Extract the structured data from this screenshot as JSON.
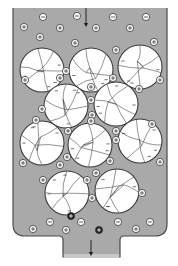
{
  "diagram": {
    "colors": {
      "background": "#ffffff",
      "liquid": "#a9a9a9",
      "vessel_outline": "#4a4a4a",
      "particle_fill": "#ffffff",
      "particle_outline": "#3a3a3a",
      "crack_lines": "#3a3a3a",
      "ion_fill": "#ffffff",
      "ion_outline": "#3a3a3a",
      "dark_ion_fill": "#1e1e1e"
    },
    "flow": {
      "inlet_arrow": {
        "x": 86,
        "y1": 8,
        "y2": 27,
        "label": "flow-in"
      },
      "outlet_arrow": {
        "x": 91,
        "y1": 240,
        "y2": 256,
        "label": "flow-out"
      }
    },
    "vessel": {
      "left": 13,
      "right": 167,
      "top": 8,
      "bottom": 236,
      "corner_radius": 12,
      "outlet": {
        "left": 63,
        "right": 120,
        "bottom": 257
      }
    },
    "particles": [
      {
        "id": 1,
        "cx": 42,
        "cy": 70,
        "r": 22
      },
      {
        "id": 2,
        "cx": 91,
        "cy": 70,
        "r": 22
      },
      {
        "id": 3,
        "cx": 140,
        "cy": 67,
        "r": 22
      },
      {
        "id": 4,
        "cx": 66,
        "cy": 106,
        "r": 22
      },
      {
        "id": 5,
        "cx": 116,
        "cy": 104,
        "r": 22
      },
      {
        "id": 6,
        "cx": 42,
        "cy": 143,
        "r": 22
      },
      {
        "id": 7,
        "cx": 90,
        "cy": 145,
        "r": 22
      },
      {
        "id": 8,
        "cx": 140,
        "cy": 141,
        "r": 22
      },
      {
        "id": 9,
        "cx": 67,
        "cy": 193,
        "r": 22
      },
      {
        "id": 10,
        "cx": 117,
        "cy": 191,
        "r": 22
      }
    ],
    "ions": [
      {
        "type": "anion",
        "symbol": "−",
        "x": 43,
        "y": 17
      },
      {
        "type": "anion",
        "symbol": "−",
        "x": 77,
        "y": 16
      },
      {
        "type": "anion",
        "symbol": "−",
        "x": 113,
        "y": 17
      },
      {
        "type": "anion",
        "symbol": "−",
        "x": 146,
        "y": 17
      },
      {
        "type": "cation",
        "symbol": "+",
        "x": 24,
        "y": 27
      },
      {
        "type": "cation",
        "symbol": "+",
        "x": 60,
        "y": 28
      },
      {
        "type": "cation",
        "symbol": "+",
        "x": 96,
        "y": 28
      },
      {
        "type": "cation",
        "symbol": "+",
        "x": 130,
        "y": 28
      },
      {
        "type": "cation",
        "symbol": "+",
        "x": 40,
        "y": 37
      },
      {
        "type": "cation",
        "symbol": "+",
        "x": 75,
        "y": 43
      },
      {
        "type": "cation",
        "symbol": "+",
        "x": 154,
        "y": 42
      },
      {
        "type": "cation",
        "symbol": "+",
        "x": 116,
        "y": 50
      },
      {
        "type": "cation",
        "symbol": "+",
        "x": 66,
        "y": 71
      },
      {
        "type": "cation",
        "symbol": "+",
        "x": 25,
        "y": 80
      },
      {
        "type": "cation",
        "symbol": "+",
        "x": 60,
        "y": 78
      },
      {
        "type": "cation",
        "symbol": "+",
        "x": 113,
        "y": 78
      },
      {
        "type": "cation",
        "symbol": "+",
        "x": 160,
        "y": 80
      },
      {
        "type": "cation",
        "symbol": "+",
        "x": 91,
        "y": 87
      },
      {
        "type": "cation",
        "symbol": "+",
        "x": 139,
        "y": 89
      },
      {
        "type": "cation",
        "symbol": "+",
        "x": 91,
        "y": 100
      },
      {
        "type": "cation",
        "symbol": "+",
        "x": 42,
        "y": 109
      },
      {
        "type": "cation",
        "symbol": "+",
        "x": 92,
        "y": 115
      },
      {
        "type": "cation",
        "symbol": "+",
        "x": 36,
        "y": 120
      },
      {
        "type": "cation",
        "symbol": "+",
        "x": 91,
        "y": 121
      },
      {
        "type": "cation",
        "symbol": "+",
        "x": 152,
        "y": 124
      },
      {
        "type": "cation",
        "symbol": "+",
        "x": 68,
        "y": 131
      },
      {
        "type": "cation",
        "symbol": "+",
        "x": 116,
        "y": 131
      },
      {
        "type": "cation",
        "symbol": "+",
        "x": 116,
        "y": 140
      },
      {
        "type": "cation",
        "symbol": "+",
        "x": 67,
        "y": 157
      },
      {
        "type": "cation",
        "symbol": "+",
        "x": 110,
        "y": 161
      },
      {
        "type": "cation",
        "symbol": "+",
        "x": 23,
        "y": 163
      },
      {
        "type": "cation",
        "symbol": "+",
        "x": 60,
        "y": 165
      },
      {
        "type": "cation",
        "symbol": "+",
        "x": 160,
        "y": 162
      },
      {
        "type": "cation",
        "symbol": "+",
        "x": 96,
        "y": 173
      },
      {
        "type": "cation",
        "symbol": "+",
        "x": 43,
        "y": 180
      },
      {
        "type": "cation",
        "symbol": "+",
        "x": 87,
        "y": 180
      },
      {
        "type": "cation",
        "symbol": "+",
        "x": 92,
        "y": 198
      },
      {
        "type": "cation",
        "symbol": "+",
        "x": 142,
        "y": 193
      },
      {
        "type": "cation_bound",
        "symbol": "+",
        "x": 71,
        "y": 216,
        "dark": true
      },
      {
        "type": "cation_bound",
        "symbol": "+",
        "x": 99,
        "y": 230,
        "dark": true
      },
      {
        "type": "anion",
        "symbol": "−",
        "x": 50,
        "y": 222
      },
      {
        "type": "anion",
        "symbol": "−",
        "x": 81,
        "y": 222
      },
      {
        "type": "anion",
        "symbol": "−",
        "x": 118,
        "y": 222
      },
      {
        "type": "anion",
        "symbol": "−",
        "x": 150,
        "y": 222
      },
      {
        "type": "cation",
        "symbol": "+",
        "x": 33,
        "y": 229
      },
      {
        "type": "cation",
        "symbol": "+",
        "x": 66,
        "y": 230
      },
      {
        "type": "cation",
        "symbol": "+",
        "x": 136,
        "y": 229
      }
    ]
  }
}
